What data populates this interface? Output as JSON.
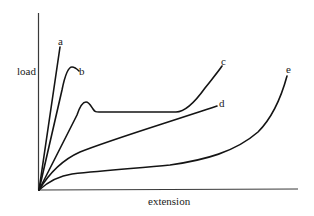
{
  "diagram": {
    "type": "load-extension curves",
    "axes": {
      "y_label": "load",
      "x_label": "extension"
    },
    "curves": [
      {
        "id": "a",
        "label": "a",
        "description": "steep linear rise, brittle"
      },
      {
        "id": "b",
        "label": "b",
        "description": "steep rise with rounded peak then slight drop"
      },
      {
        "id": "c",
        "label": "c",
        "description": "rise to yield hump, drop to long plateau, then strain-hardening upturn"
      },
      {
        "id": "d",
        "label": "d",
        "description": "concave-down rise then near-linear"
      },
      {
        "id": "e",
        "label": "e",
        "description": "quick initial rise, long gentle slope, then sharp upturn"
      }
    ],
    "colors": {
      "line": "#141414",
      "axis": "#3a3a3a",
      "background": "#ffffff"
    }
  }
}
